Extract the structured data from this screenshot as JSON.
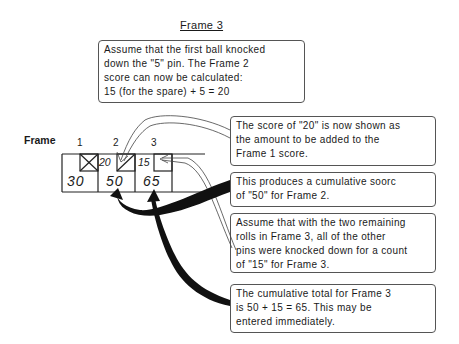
{
  "title": "Frame 3",
  "scoresheet": {
    "row_label": "Frame",
    "frame_numbers": [
      "1",
      "2",
      "3"
    ],
    "frames": [
      {
        "number": "1",
        "mark": "strike",
        "box_value": "",
        "total": "30"
      },
      {
        "number": "2",
        "mark": "spare",
        "box_value": "20",
        "total": "50"
      },
      {
        "number": "3",
        "mark": "",
        "box_value": "15",
        "total": "65"
      }
    ]
  },
  "callouts": [
    {
      "id": "first-ball",
      "text": "Assume that the first ball knocked\ndown the \"5\" pin.  The Frame 2\nscore can now be calculated:\n15 (for the spare) + 5 = 20"
    },
    {
      "id": "score-20",
      "text": "The score of \"20\" is now shown as\nthe amount to be added to the\nFrame 1 score."
    },
    {
      "id": "cumulative-50",
      "text": " This produces a cumulative soorc\nof \"50\" for Frame 2."
    },
    {
      "id": "remaining-rolls",
      "text": "Assume that with the two remaining\nrolls in Frame 3, all of the other\npins were knocked down for a count\nof \"15\" for Frame 3."
    },
    {
      "id": "cumulative-65",
      "text": " The cumulative total for Frame 3\nis 50 + 15 = 65.  This may be\nentered immediately."
    }
  ],
  "colors": {
    "ink": "#1a1a1a",
    "line": "#555555",
    "background": "#ffffff"
  }
}
